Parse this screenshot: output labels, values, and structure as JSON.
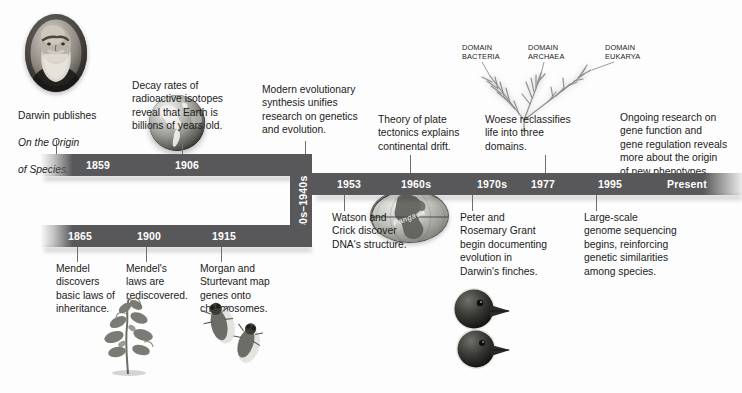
{
  "figure": {
    "type": "timeline"
  },
  "timeline": {
    "rows": [
      {
        "id": "row-top",
        "years": [
          {
            "label": "1859",
            "x": 105
          },
          {
            "label": "1906",
            "x": 192
          }
        ]
      },
      {
        "id": "row-connector",
        "years": [
          {
            "label": "1930s–1940s",
            "orientation": "vertical"
          }
        ]
      },
      {
        "id": "row-bottom",
        "years": [
          {
            "label": "1865",
            "x": 86
          },
          {
            "label": "1900",
            "x": 151
          },
          {
            "label": "1915",
            "x": 228
          }
        ]
      },
      {
        "id": "row-middle",
        "years": [
          {
            "label": "1953",
            "x": 351
          },
          {
            "label": "1960s",
            "x": 419
          },
          {
            "label": "1970s",
            "x": 494
          },
          {
            "label": "1977",
            "x": 545
          },
          {
            "label": "1995",
            "x": 614
          },
          {
            "label": "Present",
            "x": 691
          }
        ]
      }
    ]
  },
  "events": {
    "darwin": {
      "line1": "Darwin publishes",
      "line2_italic": "On the Origin",
      "line3_italic": "of Species.",
      "year": "1859",
      "art": "darwin-portrait"
    },
    "decay": {
      "text": "Decay rates of\nradioactive isotopes\nreveal that Earth is\nbillions of years old.",
      "year": "1906",
      "art": "earth-globe"
    },
    "synthesis": {
      "text": "Modern evolutionary\nsynthesis unifies\nresearch on genetics\nand evolution.",
      "year": "1930s–1940s"
    },
    "mendel_discovers": {
      "text": "Mendel\ndiscovers\nbasic laws of\ninheritance.",
      "year": "1865",
      "art": "pea-plant"
    },
    "mendel_rediscovered": {
      "text": "Mendel's\nlaws are\nrediscovered.",
      "year": "1900"
    },
    "morgan": {
      "text": "Morgan and\nSturtevant map\ngenes onto\nchromosomes.",
      "year": "1915",
      "art": "fruit-flies"
    },
    "watson_crick": {
      "text": "Watson and\nCrick discover\nDNA's structure.",
      "year": "1953",
      "art": "dna-helix"
    },
    "plate_tectonics": {
      "text": "Theory of plate\ntectonics explains\ncontinental drift.",
      "year": "1960s",
      "art": "pangaea-globe",
      "art_label": "Pangaea"
    },
    "grants": {
      "text": "Peter and\nRosemary Grant\nbegin documenting\nevolution in\nDarwin's finches.",
      "year": "1970s",
      "art": "darwin-finches"
    },
    "woese": {
      "text": "Woese reclassifies\nlife into three\ndomains.",
      "year": "1977",
      "art": "tree-of-life",
      "domain_labels": [
        "DOMAIN\nBACTERIA",
        "DOMAIN\nARCHAEA",
        "DOMAIN\nEUKARYA"
      ]
    },
    "genome": {
      "text": "Large-scale\ngenome sequencing\nbegins, reinforcing\ngenetic similarities\namong species.",
      "year": "1995",
      "art": "sequencing-chromatogram",
      "chromatogram": {
        "bases": "AGAGATCCGTGCAATTTCCGCAGTCAGGTAC",
        "ticks": [
          "270",
          "280",
          "290"
        ]
      }
    },
    "ongoing": {
      "text": "Ongoing research on\ngene function and\ngene regulation reveals\nmore about the origin\nof new phenotypes.",
      "year": "Present"
    }
  },
  "colors": {
    "bar": "#58585a",
    "bar_text": "#ffffff",
    "caption_text": "#1b1b1b",
    "leader_line": "#6d6d6f",
    "background": "#fdfdfd"
  }
}
